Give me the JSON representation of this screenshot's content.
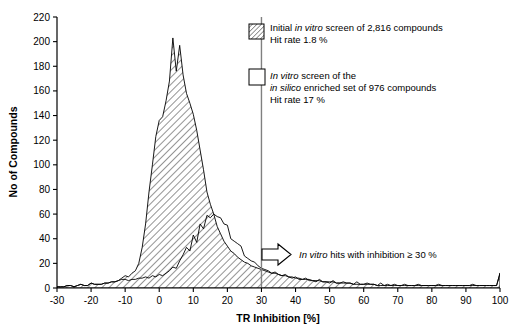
{
  "chart_data": {
    "type": "area",
    "title": "",
    "xlabel": "TR Inhibition [%]",
    "ylabel": "No of Compounds",
    "xlim": [
      -30,
      100
    ],
    "ylim": [
      0,
      220
    ],
    "xticks": [
      -30,
      -20,
      -10,
      0,
      10,
      20,
      30,
      40,
      50,
      60,
      70,
      80,
      90,
      100
    ],
    "yticks": [
      0,
      20,
      40,
      60,
      80,
      100,
      120,
      140,
      160,
      180,
      200,
      220
    ],
    "xtick_labels": [
      "-30",
      "-20",
      "-10",
      "0",
      "10",
      "20",
      "30",
      "40",
      "50",
      "60",
      "70",
      "80",
      "90",
      "100"
    ],
    "ytick_labels": [
      "0",
      "20",
      "40",
      "60",
      "80",
      "100",
      "120",
      "140",
      "160",
      "180",
      "200",
      "220"
    ],
    "grid": false,
    "legend_position": "top-right",
    "annotations": [
      {
        "name": "threshold-line",
        "type": "vline",
        "x": 30,
        "color": "#808080"
      },
      {
        "name": "hits-arrow-annotation",
        "type": "arrow-label",
        "x": 33,
        "y": 26,
        "text_parts": [
          {
            "text": "In vitro",
            "italic": true
          },
          {
            "text": " hits with inhibition ≥ 30 %",
            "italic": false
          }
        ]
      }
    ],
    "series": [
      {
        "name": "initial-in-vitro-screen",
        "fill": "hatch",
        "hatch_angle": 45,
        "line_color": "#000000",
        "legend_label_parts": [
          {
            "text": "Initial ",
            "italic": false
          },
          {
            "text": "in vitro",
            "italic": true
          },
          {
            "text": " screen of 2,816 compounds",
            "italic": false
          }
        ],
        "legend_sublabel": "Hit rate 1.8 %",
        "x": [
          -30,
          -29,
          -28,
          -27,
          -26,
          -25,
          -24,
          -23,
          -22,
          -21,
          -20,
          -19,
          -18,
          -17,
          -16,
          -15,
          -14,
          -13,
          -12,
          -11,
          -10,
          -9,
          -8,
          -7,
          -6,
          -5,
          -4,
          -3,
          -2,
          -1,
          0,
          1,
          2,
          3,
          4,
          5,
          6,
          7,
          8,
          9,
          10,
          11,
          12,
          13,
          14,
          15,
          16,
          17,
          18,
          19,
          20,
          21,
          22,
          23,
          24,
          25,
          26,
          27,
          28,
          29,
          30,
          31,
          32,
          33,
          34,
          35,
          36,
          37,
          38,
          39,
          40,
          41,
          42,
          43,
          44,
          45,
          46,
          47,
          48,
          49,
          50,
          51,
          52,
          53,
          54,
          55,
          56,
          57,
          58,
          59,
          60,
          61,
          62,
          63,
          64,
          65,
          66,
          67,
          68,
          69,
          70,
          71,
          72,
          73,
          74,
          75,
          76,
          77,
          78,
          79,
          80,
          81,
          82,
          83,
          84,
          85,
          86,
          87,
          88,
          89,
          90,
          91,
          92,
          93,
          94,
          95,
          96,
          97,
          98,
          99,
          100
        ],
        "values": [
          1,
          1,
          1,
          2,
          2,
          1,
          2,
          3,
          2,
          2,
          4,
          3,
          3,
          3,
          4,
          4,
          5,
          5,
          6,
          8,
          10,
          9,
          12,
          14,
          20,
          33,
          52,
          78,
          100,
          123,
          136,
          139,
          152,
          168,
          203,
          176,
          197,
          173,
          158,
          150,
          141,
          128,
          112,
          96,
          78,
          68,
          60,
          50,
          44,
          38,
          34,
          30,
          28,
          25,
          23,
          21,
          20,
          18,
          17,
          16,
          15,
          14,
          13,
          12,
          12,
          11,
          10,
          10,
          9,
          9,
          8,
          8,
          7,
          7,
          7,
          6,
          6,
          6,
          5,
          5,
          5,
          5,
          4,
          4,
          4,
          4,
          4,
          3,
          3,
          3,
          3,
          3,
          3,
          3,
          2,
          2,
          2,
          2,
          2,
          2,
          2,
          2,
          2,
          2,
          2,
          2,
          2,
          2,
          2,
          2,
          2,
          2,
          2,
          2,
          2,
          2,
          2,
          2,
          2,
          2,
          2,
          2,
          2,
          2,
          2,
          2,
          2,
          2,
          2,
          2,
          12
        ]
      },
      {
        "name": "in-silico-enriched-screen",
        "fill": "none",
        "line_color": "#000000",
        "legend_label_parts": [
          {
            "text": "In vitro",
            "italic": true
          },
          {
            "text": " screen of the",
            "italic": false
          }
        ],
        "legend_label_parts2": [
          {
            "text": "in silico",
            "italic": true
          },
          {
            "text": " enriched set of 976 compounds",
            "italic": false
          }
        ],
        "legend_sublabel": "Hit rate 17 %",
        "x": [
          -30,
          -29,
          -28,
          -27,
          -26,
          -25,
          -24,
          -23,
          -22,
          -21,
          -20,
          -19,
          -18,
          -17,
          -16,
          -15,
          -14,
          -13,
          -12,
          -11,
          -10,
          -9,
          -8,
          -7,
          -6,
          -5,
          -4,
          -3,
          -2,
          -1,
          0,
          1,
          2,
          3,
          4,
          5,
          6,
          7,
          8,
          9,
          10,
          11,
          12,
          13,
          14,
          15,
          16,
          17,
          18,
          19,
          20,
          21,
          22,
          23,
          24,
          25,
          26,
          27,
          28,
          29,
          30,
          31,
          32,
          33,
          34,
          35,
          36,
          37,
          38,
          39,
          40,
          41,
          42,
          43,
          44,
          45,
          46,
          47,
          48,
          49,
          50,
          51,
          52,
          53,
          54,
          55,
          56,
          57,
          58,
          59,
          60,
          61,
          62,
          63,
          64,
          65,
          66,
          67,
          68,
          69,
          70,
          71,
          72,
          73,
          74,
          75,
          76,
          77,
          78,
          79,
          80,
          81,
          82,
          83,
          84,
          85,
          86,
          87,
          88,
          89,
          90,
          91,
          92,
          93,
          94,
          95,
          96,
          97,
          98,
          99,
          100
        ],
        "values": [
          1,
          1,
          1,
          2,
          2,
          1,
          2,
          3,
          2,
          2,
          4,
          3,
          3,
          3,
          4,
          4,
          5,
          5,
          6,
          7,
          7,
          6,
          7,
          7,
          8,
          8,
          9,
          8,
          10,
          9,
          11,
          10,
          12,
          14,
          17,
          16,
          22,
          27,
          33,
          30,
          43,
          37,
          52,
          48,
          59,
          57,
          60,
          58,
          57,
          52,
          51,
          40,
          38,
          36,
          34,
          26,
          24,
          22,
          21,
          18,
          16,
          15,
          14,
          12,
          13,
          11,
          10,
          11,
          9,
          8,
          9,
          7,
          7,
          8,
          6,
          6,
          5,
          7,
          5,
          5,
          4,
          6,
          4,
          4,
          5,
          4,
          4,
          3,
          5,
          3,
          3,
          4,
          3,
          3,
          2,
          4,
          2,
          3,
          2,
          3,
          2,
          2,
          3,
          2,
          2,
          2,
          3,
          2,
          2,
          2,
          2,
          2,
          3,
          2,
          2,
          2,
          2,
          2,
          2,
          2,
          2,
          2,
          3,
          2,
          2,
          2,
          2,
          2,
          2,
          2,
          12
        ]
      }
    ]
  },
  "legend": {
    "entry1_swatch": "hatched-square",
    "entry2_swatch": "empty-square"
  },
  "icons": {
    "arrow": "right-block-arrow-icon"
  }
}
